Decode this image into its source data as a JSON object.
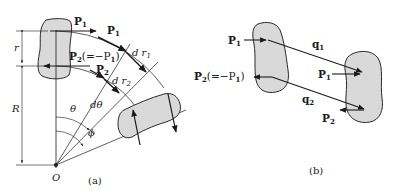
{
  "figure": {
    "panel_a": {
      "caption": "(a)",
      "labels": {
        "p1_top": "P",
        "p1_top_sub": "1",
        "p1_tangent": "P",
        "p1_tangent_sub": "1",
        "p2_eq": "P",
        "p2_eq_sub": "2",
        "p2_eq_rest": "(=−P",
        "p2_eq_rest_sub": "1",
        "p2_eq_close": ")",
        "p2_tangent": "P",
        "p2_tangent_sub": "2",
        "dr1": "d r",
        "dr1_sub": "1",
        "dr2": "d r",
        "dr2_sub": "2",
        "r": "r",
        "R": "R",
        "theta": "θ",
        "dtheta": "dθ",
        "phi": "ϕ",
        "origin": "O"
      }
    },
    "panel_b": {
      "caption": "(b)",
      "labels": {
        "p1_left": "P",
        "p1_left_sub": "1",
        "p2_left": "P",
        "p2_left_sub": "2",
        "p2_left_rest": "(=−P",
        "p2_left_rest_sub": "1",
        "p2_left_close": ")",
        "q1": "q",
        "q1_sub": "1",
        "q2": "q",
        "q2_sub": "2",
        "p1_right": "P",
        "p1_right_sub": "1",
        "p2_right": "P",
        "p2_right_sub": "2"
      }
    },
    "colors": {
      "ink": "#1a1a1a",
      "blob_fill": "#d9d9d9",
      "background": "#ffffff"
    }
  }
}
